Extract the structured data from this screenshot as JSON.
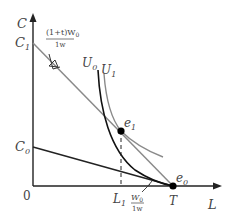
{
  "axes": {
    "y_label": "C",
    "x_label": "L",
    "origin_label": "0"
  },
  "y_ticks": [
    {
      "label": "C",
      "sub": "1",
      "y": 43
    },
    {
      "label": "C",
      "sub": "0",
      "y": 147
    }
  ],
  "x_ticks": [
    {
      "label": "L",
      "sub": "1",
      "x": 121
    },
    {
      "label": "T",
      "x": 173
    }
  ],
  "curves": {
    "u0": {
      "label": "U",
      "sub": "0"
    },
    "u1": {
      "label": "U",
      "sub": "1"
    }
  },
  "points": {
    "e0": {
      "label": "e",
      "sub": "0"
    },
    "e1": {
      "label": "e",
      "sub": "1"
    }
  },
  "annotations": {
    "slope_top_num": "(1+t)W",
    "slope_top_sub": "0",
    "slope_top_den": "1w",
    "slope_bottom_num": "W",
    "slope_bottom_sub": "0",
    "slope_bottom_den": "1w"
  },
  "colors": {
    "axis": "#222222",
    "budget_new": "#8a8a8a",
    "budget_old": "#222222",
    "indiff_u0": "#111111",
    "indiff_u1": "#8a8a8a"
  }
}
